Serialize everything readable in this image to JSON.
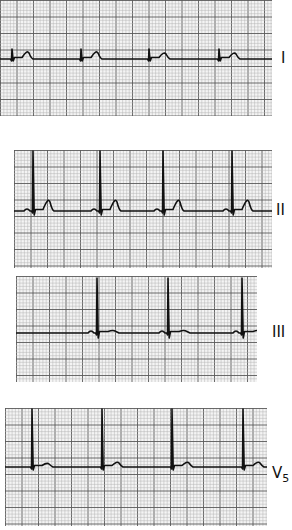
{
  "figure": {
    "grid": {
      "minor_px": 3.3,
      "major_every": 5,
      "minor_color": "#b5b5b5",
      "major_color": "#5a5a5a",
      "paper_color": "#f4f4f4"
    },
    "trace_color": "#111111"
  },
  "strips": [
    {
      "lead": "I",
      "sub": "",
      "box": {
        "x": 0,
        "y": 0,
        "w": 272,
        "h": 116
      },
      "baseline_y": 59,
      "label_pos": {
        "x": 281,
        "y": 51
      },
      "beats": [
        {
          "qrs_x": 12,
          "r_height": 10,
          "s_depth": 2,
          "t_offset": 17,
          "t_height": 6,
          "p_height": 0
        },
        {
          "qrs_x": 81,
          "r_height": 10,
          "s_depth": 2,
          "t_offset": 17,
          "t_height": 6,
          "p_height": 0
        },
        {
          "qrs_x": 149,
          "r_height": 10,
          "s_depth": 2,
          "t_offset": 17,
          "t_height": 5,
          "p_height": 0
        },
        {
          "qrs_x": 219,
          "r_height": 10,
          "s_depth": 2,
          "t_offset": 17,
          "t_height": 5,
          "p_height": 0
        }
      ]
    },
    {
      "lead": "II",
      "sub": "",
      "box": {
        "x": 14,
        "y": 150,
        "w": 258,
        "h": 118
      },
      "baseline_y": 211,
      "label_pos": {
        "x": 276,
        "y": 203
      },
      "beats": [
        {
          "qrs_x": 33,
          "r_height": 60,
          "s_depth": 4,
          "t_offset": 17,
          "t_height": 9,
          "p_height": 2
        },
        {
          "qrs_x": 100,
          "r_height": 60,
          "s_depth": 4,
          "t_offset": 17,
          "t_height": 9,
          "p_height": 2
        },
        {
          "qrs_x": 163,
          "r_height": 60,
          "s_depth": 4,
          "t_offset": 17,
          "t_height": 9,
          "p_height": 2
        },
        {
          "qrs_x": 232,
          "r_height": 60,
          "s_depth": 4,
          "t_offset": 17,
          "t_height": 9,
          "p_height": 2
        }
      ]
    },
    {
      "lead": "III",
      "sub": "",
      "box": {
        "x": 16,
        "y": 276,
        "w": 241,
        "h": 106
      },
      "baseline_y": 333,
      "label_pos": {
        "x": 272,
        "y": 325
      },
      "beats": [
        {
          "qrs_x": 97,
          "r_height": 55,
          "s_depth": 5,
          "t_offset": 18,
          "t_height": 2,
          "p_height": 2
        },
        {
          "qrs_x": 168,
          "r_height": 55,
          "s_depth": 5,
          "t_offset": 18,
          "t_height": 2,
          "p_height": 2
        },
        {
          "qrs_x": 242,
          "r_height": 55,
          "s_depth": 5,
          "t_offset": 18,
          "t_height": 2,
          "p_height": 2
        }
      ]
    },
    {
      "lead": "V",
      "sub": "5",
      "box": {
        "x": 5,
        "y": 408,
        "w": 262,
        "h": 118
      },
      "baseline_y": 467,
      "label_pos": {
        "x": 272,
        "y": 466
      },
      "beats": [
        {
          "qrs_x": 32,
          "r_height": 58,
          "s_depth": 3,
          "t_offset": 17,
          "t_height": 3,
          "p_height": 0
        },
        {
          "qrs_x": 102,
          "r_height": 58,
          "s_depth": 3,
          "t_offset": 17,
          "t_height": 4,
          "p_height": 0
        },
        {
          "qrs_x": 172,
          "r_height": 58,
          "s_depth": 3,
          "t_offset": 17,
          "t_height": 4,
          "p_height": 0
        },
        {
          "qrs_x": 243,
          "r_height": 58,
          "s_depth": 3,
          "t_offset": 17,
          "t_height": 4,
          "p_height": 0
        }
      ]
    }
  ]
}
